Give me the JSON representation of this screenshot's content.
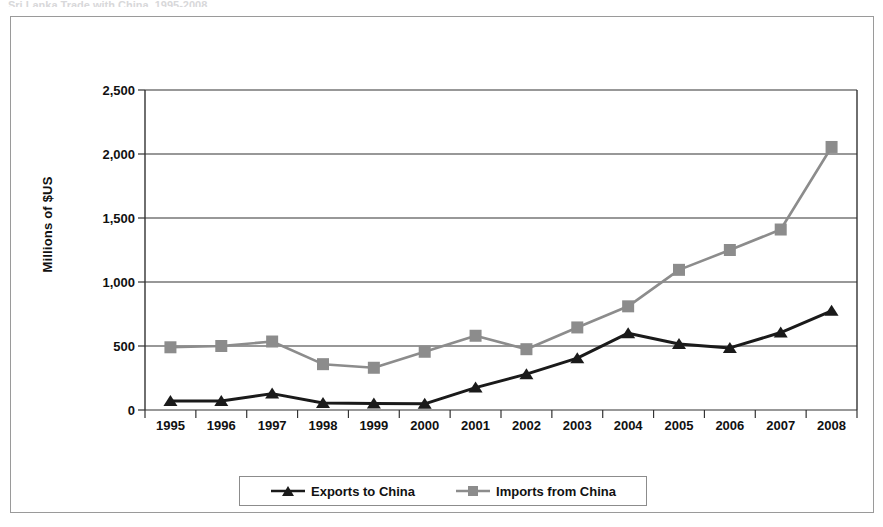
{
  "top_caption": "Sri Lanka Trade with China, 1995-2008",
  "chart_data": {
    "type": "line",
    "title": "",
    "xlabel": "",
    "ylabel": "Millions of $US",
    "categories": [
      "1995",
      "1996",
      "1997",
      "1998",
      "1999",
      "2000",
      "2001",
      "2002",
      "2003",
      "2004",
      "2005",
      "2006",
      "2007",
      "2008"
    ],
    "ylim": [
      0,
      2500
    ],
    "yticks": [
      "0",
      "500",
      "1,000",
      "1,500",
      "2,000",
      "2,500"
    ],
    "ytick_values": [
      0,
      500,
      1000,
      1500,
      2000,
      2500
    ],
    "grid": true,
    "legend_position": "bottom",
    "series": [
      {
        "name": "Exports to China",
        "marker": "triangle",
        "color": "#1a1a1a",
        "values": [
          70,
          70,
          128,
          55,
          50,
          48,
          175,
          280,
          405,
          600,
          515,
          485,
          605,
          775
        ]
      },
      {
        "name": "Imports from China",
        "marker": "square",
        "color": "#8c8c8c",
        "values": [
          490,
          500,
          535,
          358,
          330,
          455,
          580,
          475,
          645,
          810,
          1095,
          1250,
          1410,
          2055
        ]
      }
    ]
  },
  "colors": {
    "exports": "#1a1a1a",
    "imports": "#8c8c8c",
    "grid": "#333333",
    "frame": "#9a9a9a",
    "text": "#111111"
  }
}
